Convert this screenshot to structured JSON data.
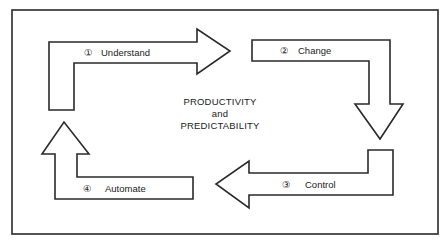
{
  "diagram": {
    "center_text": {
      "line1": "PRODUCTIVITY",
      "line2": "and",
      "line3": "PREDICTABILITY"
    },
    "steps": [
      {
        "number": "①",
        "label": "Understand",
        "direction": "right"
      },
      {
        "number": "②",
        "label": "Change",
        "direction": "down"
      },
      {
        "number": "③",
        "label": "Control",
        "direction": "left"
      },
      {
        "number": "④",
        "label": "Automate",
        "direction": "up"
      }
    ],
    "colors": {
      "stroke": "#2a2a2a",
      "fill": "#ffffff",
      "text": "#222222"
    }
  }
}
